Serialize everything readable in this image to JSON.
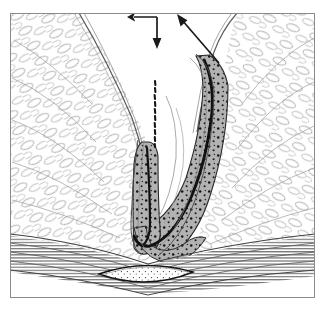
{
  "figure": {
    "medium": "grayscale pen-and-ink anatomical illustration",
    "width": 328,
    "height": 310,
    "background_color": "#ffffff",
    "frame": {
      "name": "illustration-border",
      "x": 10,
      "y": 13,
      "width": 305,
      "height": 285,
      "stroke_color": "#8a8a8a",
      "stroke_width": 1,
      "fill_color": "#ffffff"
    }
  },
  "palette": {
    "ink_black": "#1a1a1a",
    "ink_dark": "#3a3a3a",
    "line_gray": "#6b6b6b",
    "hairline_gray": "#9a9a9a",
    "fat_outline": "#7d7d7d",
    "submucosa_gray": "#b2b2b2",
    "submucosa_gray_dark": "#9c9c9c",
    "muscle_band_gray": "#767676",
    "stipple_black": "#141414",
    "paper_white": "#ffffff"
  },
  "structures": [
    {
      "id": "left-fat-pad",
      "label": "Left ischioanal fat pad",
      "description": "Large lobulated adipose tissue mass occupying the left half, drawn as elongated oval lobules radiating down and right toward the anal canal.",
      "fill_color": "#ffffff",
      "outline_color": "#7d7d7d"
    },
    {
      "id": "right-fat-pad",
      "label": "Right ischioanal fat pad",
      "description": "Lobulated adipose tissue mass occupying the right half with a rounded superior border.",
      "fill_color": "#ffffff",
      "outline_color": "#7d7d7d"
    },
    {
      "id": "anal-canal",
      "label": "Anal canal / rectal wall",
      "description": "U-shaped tubular structure descending in the midline, curving at its base, with a shaded stippled submucosal band and a heavy black mucosal line.",
      "band_fill": "#b2b2b2",
      "mucosa_line_color": "#1a1a1a"
    },
    {
      "id": "right-limb",
      "label": "Superior right limb of canal wall",
      "description": "Thick stippled gray band ascending to the upper right where the diagonal arrow terminates.",
      "band_fill": "#b2b2b2"
    },
    {
      "id": "stippled-probe-line",
      "label": "Stippled midline tract",
      "description": "Irregular dotted vertical line in the midline above the canal apex, rendered as a broken stipple stroke.",
      "color": "#141414",
      "x": 155,
      "y_top": 81,
      "y_bottom": 147
    },
    {
      "id": "striated-muscle-layer",
      "label": "Striated muscle layer",
      "description": "Horizontal band of long parallel hatched striations across the lower portion, dipping toward the midline.",
      "color": "#767676"
    },
    {
      "id": "lenticular-body",
      "label": "Lens-shaped body in muscle layer",
      "description": "Elongated lens / oval outline at the bottom midline filled with fine scattered stipple, seated within the striated muscle band.",
      "outline_color": "#1a1a1a",
      "fill_color": "#ffffff",
      "cx": 145,
      "cy": 275,
      "rx": 48,
      "ry": 10
    }
  ],
  "annotations": [
    {
      "id": "arrow-down",
      "name": "downward-arrow",
      "type": "arrow",
      "direction": "down",
      "label": "",
      "color": "#1a1a1a",
      "tail": {
        "x": 157,
        "y": 17
      },
      "head": {
        "x": 157,
        "y": 48
      }
    },
    {
      "id": "arrow-diagonal",
      "name": "diagonal-arrow",
      "type": "arrow",
      "direction": "up-left",
      "label": "",
      "color": "#1a1a1a",
      "tail": {
        "x": 219,
        "y": 63
      },
      "head": {
        "x": 177,
        "y": 14
      }
    }
  ],
  "texture": {
    "fat_lobule_count_left": 120,
    "fat_lobule_count_right": 110,
    "stipple_dot_count": 150,
    "muscle_striation_count": 26,
    "note": "No text labels, legends, axis ticks, numbers or callout letters appear anywhere in the image."
  }
}
